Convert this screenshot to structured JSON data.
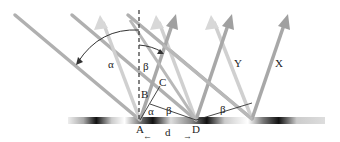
{
  "figure": {
    "labels": {
      "alpha_top": "α",
      "beta_top": "β",
      "C": "C",
      "B": "B",
      "A": "A",
      "alpha_bottom": "α",
      "beta_AD": "β",
      "D": "D",
      "beta_D": "β",
      "Y": "Y",
      "X": "X",
      "d": "d"
    },
    "colors": {
      "ray": "#a9a9a9",
      "ray_light": "#d4d4d4",
      "surface_dark": "#111111",
      "arc": "#333333"
    }
  }
}
